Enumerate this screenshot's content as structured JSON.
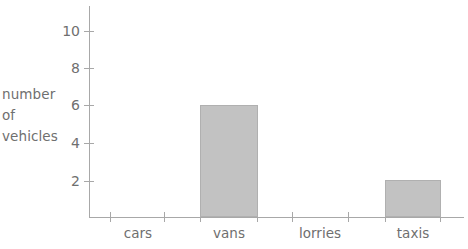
{
  "chart_data": {
    "type": "bar",
    "title": "",
    "subtitle": "",
    "xlabel": "",
    "ylabel": "number of vehicles",
    "categories": [
      "cars",
      "vans",
      "lorries",
      "taxis"
    ],
    "values": [
      0,
      6,
      0,
      2
    ],
    "series": [
      {
        "name": "number of vehicles",
        "values": [
          0,
          6,
          0,
          2
        ]
      }
    ],
    "ylim": [
      0,
      11
    ],
    "y_ticks": [
      2,
      4,
      6,
      8,
      10
    ],
    "y_tick_labels": [
      "2",
      "4",
      "6",
      "8",
      "10"
    ],
    "grid": false,
    "legend": false,
    "bar_color": "#c2c2c2",
    "bar_border_color": "#b0b0b0",
    "axis_color": "#a8a8a8",
    "text_color": "#6f6f6f"
  },
  "axis": {
    "y_title_lines": [
      "number",
      "of",
      "vehicles"
    ],
    "y_labels": [
      "10",
      "8",
      "6",
      "4",
      "2"
    ]
  },
  "categories": [
    {
      "label": "cars"
    },
    {
      "label": "vans"
    },
    {
      "label": "lorries"
    },
    {
      "label": "taxis"
    }
  ]
}
